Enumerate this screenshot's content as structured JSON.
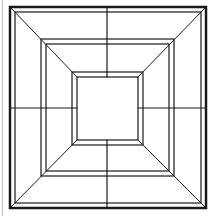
{
  "diagram": {
    "title": "",
    "stroke_color": "#1a1a1a",
    "faint_color": "#bdbdbd",
    "background": "#ffffff",
    "left_edge_line": {
      "x": 2.5,
      "y1": 0,
      "y2": 216
    },
    "frames": [
      {
        "name": "outer",
        "outer": [
          10,
          7,
          206,
          208
        ],
        "inner": [
          15,
          12,
          201,
          203
        ],
        "outer_width": 2.5,
        "inner_width": 1.2
      },
      {
        "name": "middle",
        "outer": [
          41,
          39,
          174,
          176
        ],
        "inner": [
          46,
          44,
          169,
          171
        ],
        "outer_width": 1.2,
        "inner_width": 1.2
      },
      {
        "name": "inner",
        "outer": [
          72,
          72,
          143,
          145
        ],
        "inner": [
          77,
          77,
          138,
          140
        ],
        "outer_width": 1.2,
        "inner_width": 1.2
      }
    ],
    "center_cross": {
      "x": 107,
      "y": 108,
      "x1": 10,
      "x2": 206,
      "y1": 7,
      "y2": 208
    },
    "diagonals": [
      [
        [
          11,
          8
        ],
        [
          77,
          77
        ]
      ],
      [
        [
          205,
          8
        ],
        [
          138,
          77
        ]
      ],
      [
        [
          11,
          207
        ],
        [
          77,
          140
        ]
      ],
      [
        [
          205,
          207
        ],
        [
          138,
          140
        ]
      ]
    ]
  }
}
